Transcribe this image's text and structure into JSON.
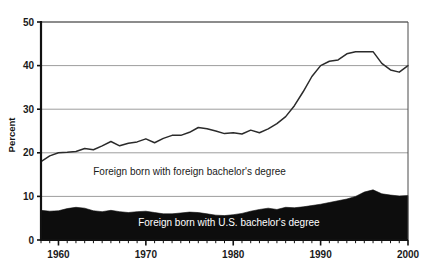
{
  "chart_data": {
    "type": "area",
    "title": "",
    "subtitle": "",
    "xlabel": "",
    "ylabel": "Percent",
    "xlim": [
      1958,
      2000
    ],
    "ylim": [
      0,
      50
    ],
    "yticks": [
      0,
      10,
      20,
      30,
      40,
      50
    ],
    "ytick_labels": [
      "0",
      "10",
      "20",
      "30",
      "40",
      "50"
    ],
    "xticks": [
      1960,
      1970,
      1980,
      1990,
      2000
    ],
    "xtick_labels": [
      "1960",
      "1970",
      "1980",
      "1990",
      "2000"
    ],
    "minor_xtick_interval": 1,
    "grid": "horizontal",
    "legend": "inline-annotations",
    "annotations": [
      {
        "text": "Foreign born with foreign bachelor's degree",
        "x": 1975.0,
        "y": 15.0,
        "color": "#1a1a1a"
      },
      {
        "text": "Foreign born with U.S. bachelor's degree",
        "x": 1979.5,
        "y": 3.2,
        "color": "#ffffff"
      }
    ],
    "x": [
      1958,
      1959,
      1960,
      1961,
      1962,
      1963,
      1964,
      1965,
      1966,
      1967,
      1968,
      1969,
      1970,
      1971,
      1972,
      1973,
      1974,
      1975,
      1976,
      1977,
      1978,
      1979,
      1980,
      1981,
      1982,
      1983,
      1984,
      1985,
      1986,
      1987,
      1988,
      1989,
      1990,
      1991,
      1992,
      1993,
      1994,
      1995,
      1996,
      1997,
      1998,
      1999,
      2000
    ],
    "series": [
      {
        "name": "Foreign born with foreign bachelor's degree",
        "style": "line",
        "color": "#2b2b2b",
        "values": [
          18.0,
          19.3,
          20.0,
          20.1,
          20.3,
          21.0,
          20.7,
          21.6,
          22.6,
          21.6,
          22.2,
          22.5,
          23.2,
          22.3,
          23.3,
          24.0,
          24.0,
          24.7,
          25.8,
          25.5,
          25.0,
          24.4,
          24.6,
          24.3,
          25.2,
          24.6,
          25.5,
          26.7,
          28.3,
          30.8,
          34.0,
          37.5,
          40.0,
          41.0,
          41.3,
          42.7,
          43.2,
          43.2,
          43.2,
          40.5,
          39.0,
          38.5,
          40.0
        ]
      },
      {
        "name": "Foreign born with U.S. bachelor's degree",
        "style": "filled-area",
        "color": "#0d0d0d",
        "values": [
          6.8,
          6.6,
          6.7,
          7.2,
          7.5,
          7.3,
          6.7,
          6.5,
          6.8,
          6.5,
          6.3,
          6.5,
          6.6,
          6.3,
          6.0,
          6.0,
          6.2,
          6.4,
          6.3,
          6.0,
          5.7,
          5.6,
          5.8,
          6.1,
          6.6,
          7.0,
          7.3,
          7.0,
          7.5,
          7.4,
          7.6,
          7.9,
          8.2,
          8.6,
          9.0,
          9.4,
          10.0,
          11.0,
          11.5,
          10.6,
          10.3,
          10.1,
          10.2
        ]
      }
    ]
  },
  "axis": {
    "y_title": "Percent"
  }
}
